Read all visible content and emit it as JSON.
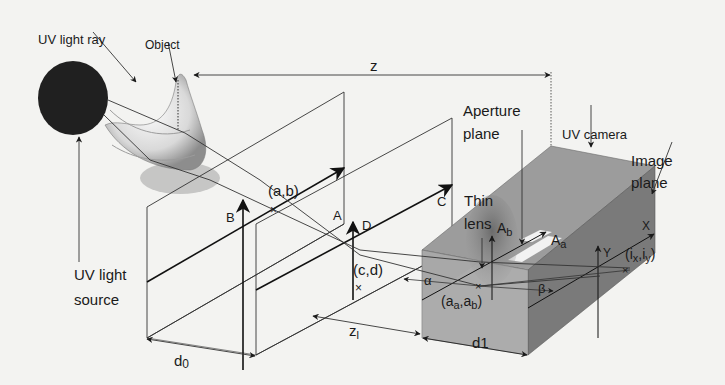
{
  "diagram": {
    "colors": {
      "background": "#f3f3f1",
      "ink": "#1a1a1a",
      "light_source": "#202020",
      "camera_top": "#9a9a9a",
      "camera_front": "#a9a9a9",
      "camera_side": "#7b7b7b",
      "aperture_window": "#f2f2f2"
    },
    "labels": {
      "uv_light_ray": "UV light ray",
      "object": "Object",
      "uv_light_source_line1": "UV light",
      "uv_light_source_line2": "source",
      "z": "z",
      "aperture_plane_line1": "Aperture",
      "aperture_plane_line2": "plane",
      "uv_camera": "UV camera",
      "image_plane_line1": "Image",
      "image_plane_line2": "plane",
      "thin_lens_line1": "Thin",
      "thin_lens_line2": "lens",
      "point_ab": "(a,b)",
      "point_cd": "(c,d)",
      "axis_A": "A",
      "axis_B": "B",
      "axis_C": "C",
      "axis_D": "D",
      "axis_Ab": "Ab",
      "axis_Aa": "Aa",
      "axis_Y": "Y",
      "axis_X": "X",
      "point_ixiy": "(ix,iy)",
      "point_aaab": "(aa,ab)",
      "alpha": "α",
      "beta": "β",
      "d0": "d0",
      "d1": "d1",
      "zl": "zl"
    },
    "icons": [
      "uv-light-source-ellipse",
      "banana-object",
      "uv-camera-box",
      "thin-lens-ellipse"
    ]
  }
}
